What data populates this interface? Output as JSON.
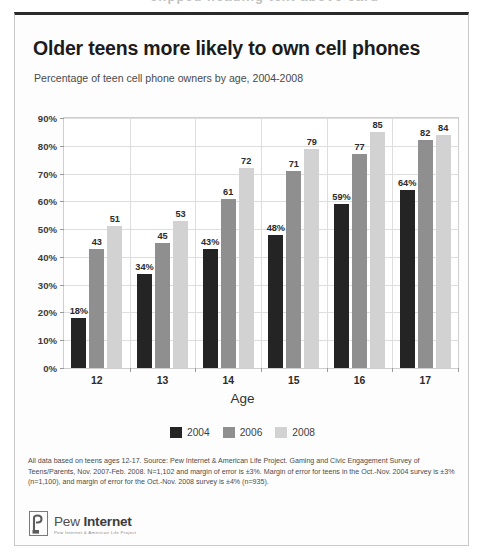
{
  "page_artifact": "clipped heading text above card",
  "card": {
    "title": "Older teens more likely to own cell phones",
    "subtitle": "Percentage of teen cell phone owners by age, 2004-2008",
    "x_axis_title": "Age",
    "footnote": "All data based on teens ages 12-17. Source: Pew Internet & American Life Project. Gaming and Civic Engagement Survey of Teens/Parents, Nov. 2007-Feb. 2008. N=1,102 and margin of error is ±3%. Margin of error for teens in the Oct.-Nov. 2004 survey is ±3% (n=1,100), and margin of error for the Oct.-Nov. 2008 survey is ±4% (n=935).",
    "logo": {
      "name_light": "Pew ",
      "name_bold": "Internet",
      "tagline": "Pew Internet & American Life Project"
    }
  },
  "chart_data": {
    "type": "bar",
    "title": "Older teens more likely to own cell phones",
    "subtitle": "Percentage of teen cell phone owners by age, 2004-2008",
    "xlabel": "Age",
    "ylabel": "",
    "ylim": [
      0,
      90
    ],
    "ytick_values": [
      0,
      10,
      20,
      30,
      40,
      50,
      60,
      70,
      80,
      90
    ],
    "ytick_labels": [
      "0%",
      "10%",
      "20%",
      "30%",
      "40%",
      "50%",
      "60%",
      "70%",
      "80%",
      "90%"
    ],
    "grid": true,
    "legend_position": "bottom",
    "categories": [
      "12",
      "13",
      "14",
      "15",
      "16",
      "17"
    ],
    "series": [
      {
        "name": "2004",
        "color": "#242424",
        "values": [
          18,
          34,
          43,
          48,
          59,
          64
        ],
        "labels": [
          "18%",
          "34%",
          "43%",
          "48%",
          "59%",
          "64%"
        ]
      },
      {
        "name": "2006",
        "color": "#8f8f8f",
        "values": [
          43,
          45,
          61,
          71,
          77,
          82
        ],
        "labels": [
          "43",
          "45",
          "61",
          "71",
          "77",
          "82"
        ]
      },
      {
        "name": "2008",
        "color": "#d2d2d2",
        "values": [
          51,
          53,
          72,
          79,
          85,
          84
        ],
        "labels": [
          "51",
          "53",
          "72",
          "79",
          "85",
          "84"
        ]
      }
    ]
  }
}
